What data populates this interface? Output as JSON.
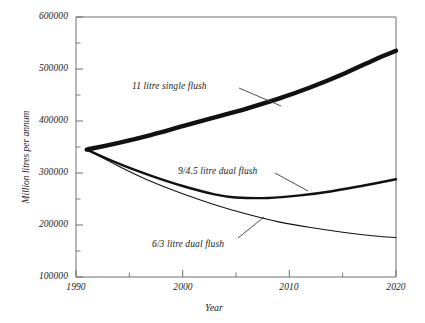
{
  "chart_data": {
    "type": "line",
    "title": "",
    "xlabel": "Year",
    "ylabel": "Million litres per annum",
    "xlim": [
      1990,
      2020
    ],
    "ylim": [
      100000,
      600000
    ],
    "xticks": [
      1990,
      2000,
      2010,
      2020
    ],
    "xtick_labels": [
      "1990",
      "2000",
      "2010",
      "2020"
    ],
    "xminor_ticks": [
      1995,
      2005,
      2015
    ],
    "yticks": [
      100000,
      200000,
      300000,
      400000,
      500000,
      600000
    ],
    "ytick_labels": [
      "100000",
      "200000",
      "300000",
      "400000",
      "500000",
      "600000"
    ],
    "yminor_ticks": [
      150000,
      250000,
      350000,
      450000,
      550000
    ],
    "grid": false,
    "legend": "annotations-with-leader-lines",
    "series": [
      {
        "name": "11 litre single flush",
        "style": "thick",
        "x": [
          1991,
          1994,
          1997,
          2000,
          2003,
          2006,
          2009,
          2012,
          2015,
          2018,
          2020
        ],
        "values": [
          345000,
          358000,
          373000,
          390000,
          407000,
          424000,
          443000,
          465000,
          490000,
          518000,
          535000
        ]
      },
      {
        "name": "9/4.5 litre dual flush",
        "style": "medium",
        "x": [
          1991,
          1994,
          1997,
          2000,
          2003,
          2005,
          2008,
          2011,
          2014,
          2017,
          2020
        ],
        "values": [
          345000,
          318000,
          295000,
          275000,
          259000,
          253000,
          252000,
          257000,
          265000,
          276000,
          288000
        ]
      },
      {
        "name": "6/3 litre dual flush",
        "style": "thin",
        "x": [
          1991,
          1994,
          1997,
          2000,
          2003,
          2006,
          2009,
          2012,
          2015,
          2018,
          2020
        ],
        "values": [
          345000,
          313000,
          284000,
          260000,
          239000,
          221000,
          206000,
          195000,
          186000,
          179000,
          176000
        ]
      }
    ],
    "annotations": [
      {
        "text": "11 litre single flush",
        "label_x": 132,
        "label_y": 82
      },
      {
        "text": "9/4.5 litre dual flush",
        "label_x": 178,
        "label_y": 167
      },
      {
        "text": "6/3 litre dual flush",
        "label_x": 152,
        "label_y": 240
      }
    ]
  },
  "axes": {
    "x_title": "Year",
    "y_title": "Million litres per annum"
  },
  "colors": {
    "background": "#ffffff",
    "axis": "#6e6e6e",
    "line": "#111111",
    "text": "#222222"
  }
}
